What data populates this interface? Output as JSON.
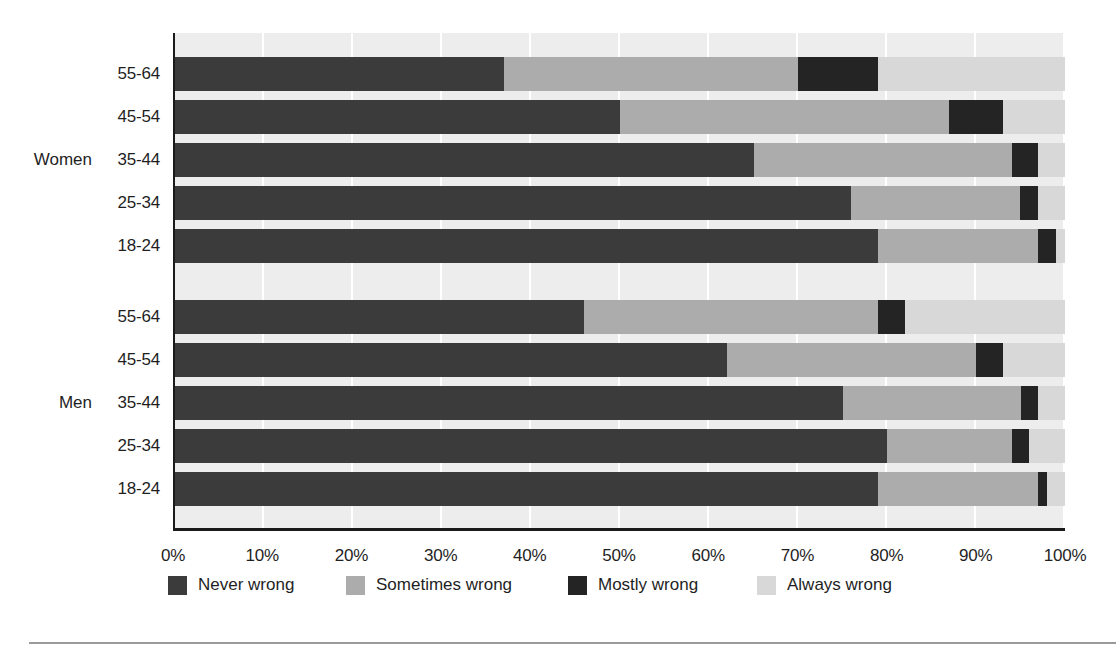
{
  "chart_data": {
    "type": "bar",
    "orientation": "horizontal",
    "stacked": true,
    "title": "",
    "xlabel": "",
    "ylabel": "",
    "xlim": [
      0,
      100
    ],
    "x_ticks": [
      "0%",
      "10%",
      "20%",
      "30%",
      "40%",
      "50%",
      "60%",
      "70%",
      "80%",
      "90%",
      "100%"
    ],
    "grid": "vertical white gridlines every 10%",
    "legend_position": "bottom",
    "groups": [
      "Women",
      "Men"
    ],
    "categories": [
      "55-64",
      "45-54",
      "35-44",
      "25-34",
      "18-24"
    ],
    "series_names": [
      "Never wrong",
      "Sometimes wrong",
      "Mostly wrong",
      "Always wrong"
    ],
    "series_colors": [
      "#3b3b3b",
      "#acacac",
      "#242424",
      "#d8d8d8"
    ],
    "rows": [
      {
        "group": "Women",
        "age": "55-64",
        "values": [
          37,
          33,
          9,
          21
        ]
      },
      {
        "group": "Women",
        "age": "45-54",
        "values": [
          50,
          37,
          6,
          7
        ]
      },
      {
        "group": "Women",
        "age": "35-44",
        "values": [
          65,
          29,
          3,
          3
        ]
      },
      {
        "group": "Women",
        "age": "25-34",
        "values": [
          76,
          19,
          2,
          3
        ]
      },
      {
        "group": "Women",
        "age": "18-24",
        "values": [
          79,
          18,
          2,
          1
        ]
      },
      {
        "group": "Men",
        "age": "55-64",
        "values": [
          46,
          33,
          3,
          18
        ]
      },
      {
        "group": "Men",
        "age": "45-54",
        "values": [
          62,
          28,
          3,
          7
        ]
      },
      {
        "group": "Men",
        "age": "35-44",
        "values": [
          75,
          20,
          2,
          3
        ]
      },
      {
        "group": "Men",
        "age": "25-34",
        "values": [
          80,
          14,
          2,
          4
        ]
      },
      {
        "group": "Men",
        "age": "18-24",
        "values": [
          79,
          18,
          1,
          2
        ]
      }
    ]
  },
  "legend": {
    "items": [
      {
        "label": "Never wrong",
        "color": "#3b3b3b"
      },
      {
        "label": "Sometimes wrong",
        "color": "#acacac"
      },
      {
        "label": "Mostly wrong",
        "color": "#242424"
      },
      {
        "label": "Always wrong",
        "color": "#d8d8d8"
      }
    ]
  },
  "colors": {
    "plot_background": "#ededed",
    "gridline": "#ffffff",
    "axis": "#1a1a1a",
    "text": "#1f1f1f",
    "divider": "#9a9a9a",
    "page_background": "#ffffff"
  }
}
